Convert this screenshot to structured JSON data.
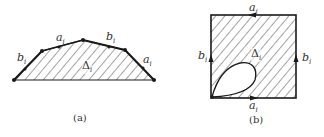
{
  "figures": [
    {
      "id": "a",
      "caption": "(a)",
      "region_label": "Δ",
      "region_sub": "i",
      "edge_labels": [
        {
          "base": "b",
          "sub": "i"
        },
        {
          "base": "a",
          "sub": "i"
        },
        {
          "base": "b",
          "sub": "i"
        },
        {
          "base": "a",
          "sub": "i"
        }
      ]
    },
    {
      "id": "b",
      "caption": "(b)",
      "region_label": "Δ",
      "region_sub": "i",
      "edge_labels": [
        {
          "base": "a",
          "sub": "i",
          "position": "top"
        },
        {
          "base": "b",
          "sub": "i",
          "position": "left"
        },
        {
          "base": "b",
          "sub": "i",
          "position": "right"
        },
        {
          "base": "a",
          "sub": "i",
          "position": "bottom"
        }
      ]
    }
  ],
  "colors": {
    "stroke": "#1a1a1a",
    "hatch": "#333333",
    "text": "#333333",
    "background": "#ffffff"
  }
}
